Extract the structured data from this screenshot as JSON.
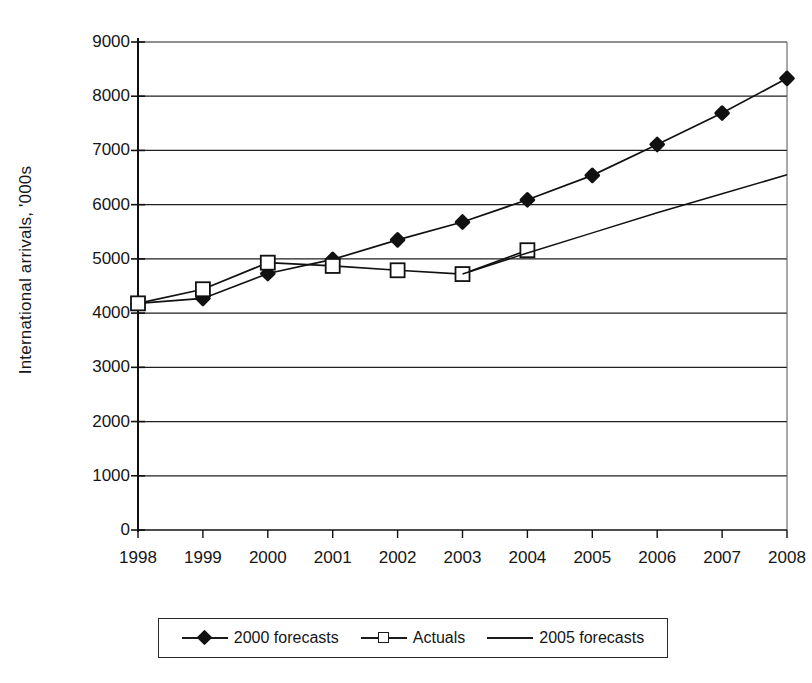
{
  "chart_data": {
    "type": "line",
    "title": "",
    "xlabel": "",
    "ylabel": "International arrivals, '000s",
    "x": [
      1998,
      1999,
      2000,
      2001,
      2002,
      2003,
      2004,
      2005,
      2006,
      2007,
      2008
    ],
    "xtick_labels": [
      "1998",
      "1999",
      "2000",
      "2001",
      "2002",
      "2003",
      "2004",
      "2005",
      "2006",
      "2007",
      "2008"
    ],
    "ytick_labels": [
      "0",
      "1000",
      "2000",
      "3000",
      "4000",
      "5000",
      "6000",
      "7000",
      "8000",
      "9000"
    ],
    "yticks": [
      0,
      1000,
      2000,
      3000,
      4000,
      5000,
      6000,
      7000,
      8000,
      9000
    ],
    "ylim": [
      0,
      9000
    ],
    "grid": "horizontal",
    "legend_position": "bottom",
    "series": [
      {
        "name": "2000 forecasts",
        "marker": "filled-diamond",
        "x": [
          1998,
          1999,
          2000,
          2001,
          2002,
          2003,
          2004,
          2005,
          2006,
          2007,
          2008
        ],
        "values": [
          4180,
          4270,
          4730,
          4990,
          5350,
          5680,
          6090,
          6540,
          7110,
          7690,
          8330
        ]
      },
      {
        "name": "Actuals",
        "marker": "open-square",
        "x": [
          1998,
          1999,
          2000,
          2001,
          2002,
          2003,
          2004
        ],
        "values": [
          4180,
          4440,
          4930,
          4870,
          4790,
          4720,
          5160
        ]
      },
      {
        "name": "2005 forecasts",
        "marker": "none",
        "x": [
          2003,
          2004,
          2005,
          2006,
          2007,
          2008
        ],
        "values": [
          4720,
          5110,
          5480,
          5850,
          6200,
          6550
        ]
      }
    ]
  },
  "axis": {
    "ylabel": "International arrivals, '000s"
  },
  "legend": {
    "items": [
      {
        "label": "2000 forecasts",
        "key": "filled-diamond-line"
      },
      {
        "label": "Actuals",
        "key": "open-square-line"
      },
      {
        "label": "2005 forecasts",
        "key": "plain-line"
      }
    ]
  }
}
